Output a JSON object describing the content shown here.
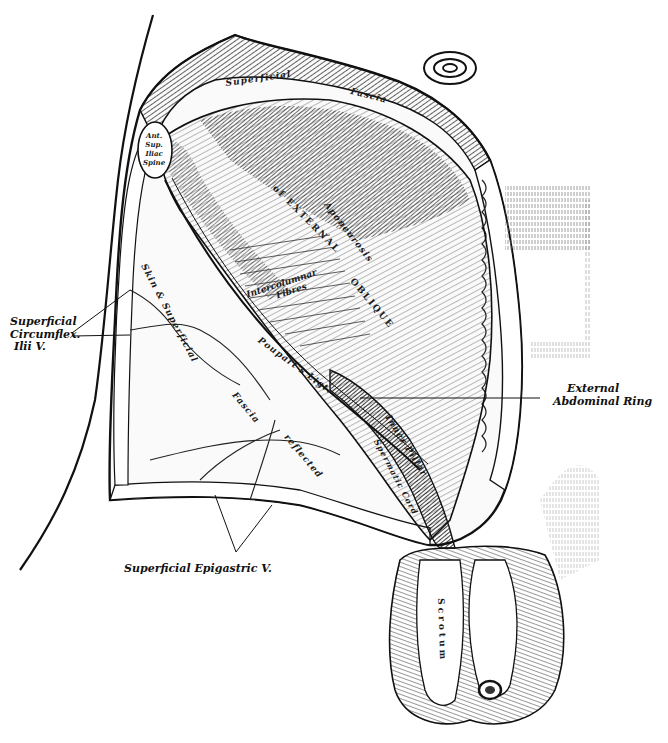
{
  "figure": {
    "background": "#ffffff",
    "ink": "#111111"
  },
  "external_labels": {
    "superficial_circumflex_ilii_v": {
      "line1": "Superficial",
      "line2": "Circumflex.",
      "line3": "Ilii V."
    },
    "external_abdominal_ring": {
      "line1": "External",
      "line2": "Abdominal Ring"
    },
    "superficial_epigastric_v": {
      "text": "Superficial Epigastric V."
    }
  },
  "internal_labels": {
    "superficial_fascia_1": "Superficial",
    "superficial_fascia_2": "Fascia",
    "ant_sup_iliac_spine": [
      "Ant.",
      "Sup.",
      "Iliac",
      "Spine"
    ],
    "aponeurosis": "Aponeurosis",
    "of_external": "of EXTERNAL",
    "oblique": "OBLIQUE",
    "intercolumnar_fibres_1": "Intercolumnar",
    "intercolumnar_fibres_2": "Fibres",
    "skin_superficial": "Skin & Superficial",
    "fascia_reflected_1": "Fascia",
    "fascia_reflected_2": "reflected",
    "pouparts_ligt": "Poupart's Ligt.",
    "inner_pillar": "Inner Pillar",
    "spermatic_cord": "Spermatic Cord",
    "scrotum": "Scrotum"
  }
}
